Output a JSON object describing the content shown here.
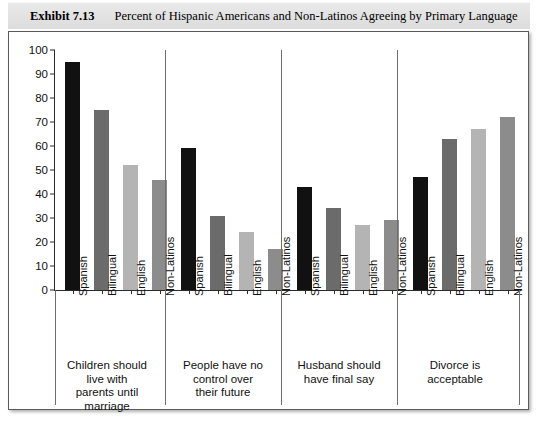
{
  "header": {
    "exhibit_number": "Exhibit 7.13",
    "title": "Percent of Hispanic Americans and Non-Latinos Agreeing by Primary Language"
  },
  "chart_data": {
    "type": "bar",
    "title": "Percent of Hispanic Americans and Non-Latinos Agreeing by Primary Language",
    "xlabel": "",
    "ylabel": "",
    "ylim": [
      0,
      100
    ],
    "ytick_values": [
      0,
      10,
      20,
      30,
      40,
      50,
      60,
      70,
      80,
      90,
      100
    ],
    "ytick_labels": [
      "0",
      "10",
      "20",
      "30",
      "40",
      "50",
      "60",
      "70",
      "80",
      "90",
      "100"
    ],
    "grid": false,
    "legend": "none",
    "categories": [
      "Spanish",
      "Bilingual",
      "English",
      "Non-Latinos"
    ],
    "series_colors": [
      "#111111",
      "#6b6b6b",
      "#b4b4b4",
      "#8c8c8c"
    ],
    "groups": [
      {
        "caption": "Children should live with parents until marriage",
        "caption_lines": [
          "Children should",
          "live with",
          "parents until",
          "marriage"
        ],
        "values": [
          95,
          75,
          52,
          46
        ]
      },
      {
        "caption": "People have no control over their future",
        "caption_lines": [
          "People have no",
          "control over",
          "their future"
        ],
        "values": [
          59,
          31,
          24,
          17
        ]
      },
      {
        "caption": "Husband should have final say",
        "caption_lines": [
          "Husband should",
          "have final say"
        ],
        "values": [
          43,
          34,
          27,
          29
        ]
      },
      {
        "caption": "Divorce is acceptable",
        "caption_lines": [
          "Divorce is",
          "acceptable"
        ],
        "values": [
          47,
          63,
          67,
          72
        ]
      }
    ]
  }
}
